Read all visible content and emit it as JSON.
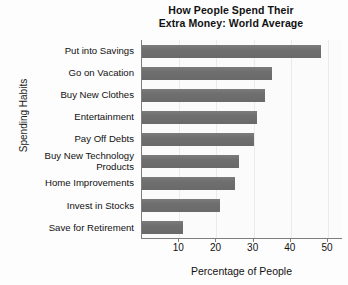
{
  "chart_data": {
    "type": "bar",
    "orientation": "horizontal",
    "title": "How People Spend Their Extra Money: World Average",
    "title_line1": "How People Spend Their",
    "title_line2": "Extra Money: World Average",
    "xlabel": "Percentage of People",
    "ylabel": "Spending Habits",
    "categories": [
      "Put into Savings",
      "Go on Vacation",
      "Buy New Clothes",
      "Entertainment",
      "Pay Off Debts",
      "Buy New Technology\nProducts",
      "Home Improvements",
      "Invest in Stocks",
      "Save for Retirement"
    ],
    "values": [
      48,
      35,
      33,
      31,
      30,
      26,
      25,
      21,
      11
    ],
    "xticks": [
      10,
      20,
      30,
      40,
      50
    ],
    "xlim": [
      0,
      54
    ],
    "grid": true,
    "legend": "none",
    "bar_color": "#6f6f6f",
    "axis_color": "#7d7d7d",
    "plot_background": "#fbfbfb"
  }
}
